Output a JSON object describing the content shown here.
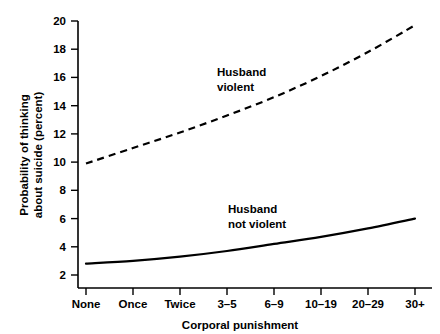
{
  "chart_data": {
    "type": "line",
    "title": "",
    "xlabel": "Corporal punishment",
    "ylabel_line1": "Probability of thinking",
    "ylabel_line2": "about suicide (percent)",
    "categories": [
      "None",
      "Once",
      "Twice",
      "3–5",
      "6–9",
      "10–19",
      "20–29",
      "30+"
    ],
    "ylim": [
      2,
      20
    ],
    "yticks": [
      2,
      4,
      6,
      8,
      10,
      12,
      14,
      16,
      18,
      20
    ],
    "ytick_labels": [
      "2",
      "4",
      "6",
      "8",
      "10",
      "12",
      "14",
      "16",
      "18",
      "20"
    ],
    "grid": false,
    "legend_position": "inline-annotation",
    "series": [
      {
        "name": "Husband violent",
        "style": "dashed",
        "color": "#000000",
        "label_line1": "Husband",
        "label_line2": "violent",
        "values": [
          9.9,
          11.0,
          12.1,
          13.3,
          14.6,
          16.1,
          17.8,
          19.7
        ]
      },
      {
        "name": "Husband not violent",
        "style": "solid",
        "color": "#000000",
        "label_line1": "Husband",
        "label_line2": "not violent",
        "values": [
          2.8,
          3.0,
          3.3,
          3.7,
          4.2,
          4.7,
          5.3,
          6.0
        ]
      }
    ],
    "annotations": [
      {
        "text_line1": "Husband",
        "text_line2": "violent",
        "series": "Husband violent"
      },
      {
        "text_line1": "Husband",
        "text_line2": "not violent",
        "series": "Husband not violent"
      }
    ]
  }
}
